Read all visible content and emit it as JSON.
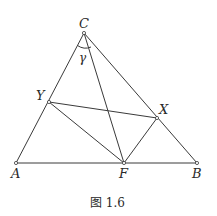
{
  "figure": {
    "caption": "图 1.6",
    "points": {
      "A": {
        "label": "A",
        "x": 16,
        "y": 163
      },
      "B": {
        "label": "B",
        "x": 197,
        "y": 163
      },
      "C": {
        "label": "C",
        "x": 84,
        "y": 33
      },
      "F": {
        "label": "F",
        "x": 124,
        "y": 163
      },
      "X": {
        "label": "X",
        "x": 157,
        "y": 118
      },
      "Y": {
        "label": "Y",
        "x": 49,
        "y": 102
      }
    },
    "angle_label": "γ",
    "segments": [
      [
        "A",
        "B"
      ],
      [
        "B",
        "C"
      ],
      [
        "C",
        "A"
      ],
      [
        "C",
        "F"
      ],
      [
        "Y",
        "F"
      ],
      [
        "X",
        "F"
      ],
      [
        "Y",
        "X"
      ]
    ],
    "colors": {
      "stroke": "#3a3a3a",
      "text": "#2a2a2a",
      "background": "#ffffff"
    }
  }
}
